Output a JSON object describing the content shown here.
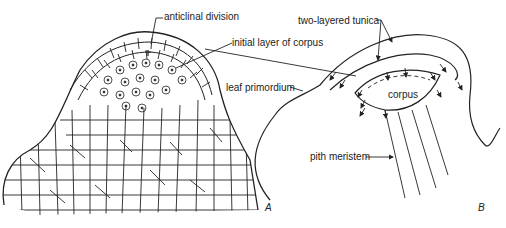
{
  "figure": {
    "panel_a": {
      "label": "A",
      "labels": {
        "anticlinal_division": "anticlinal division",
        "initial_layer": "initial layer of corpus",
        "leaf_primordium": "leaf primordium"
      }
    },
    "panel_b": {
      "label": "B",
      "labels": {
        "tunica": "two-layered tunica",
        "corpus": "corpus",
        "pith_meristem": "pith meristem"
      }
    },
    "colors": {
      "ink": "#222222",
      "background": "#ffffff"
    }
  }
}
